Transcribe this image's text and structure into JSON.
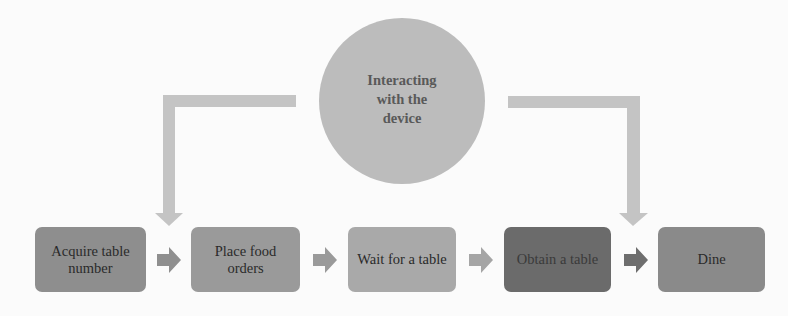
{
  "diagram": {
    "type": "process-flow",
    "hub": {
      "label": "Interacting with the device",
      "fill": "#bcbcbc",
      "text_color": "#595959"
    },
    "connectors": [
      {
        "from": "hub",
        "to": "steps.0",
        "color": "#c4c4c4"
      },
      {
        "from": "hub",
        "to": "steps.4",
        "color": "#c4c4c4"
      }
    ],
    "steps": [
      {
        "label": "Acquire table number",
        "fill": "#8e8e8e"
      },
      {
        "label": "Place food orders",
        "fill": "#9a9a9a"
      },
      {
        "label": "Wait for a table",
        "fill": "#a9a9a9"
      },
      {
        "label": "Obtain a table",
        "fill": "#6b6b6b"
      },
      {
        "label": "Dine",
        "fill": "#8a8a8a"
      }
    ],
    "flow_arrows": [
      {
        "from": 0,
        "to": 1,
        "color": "#8f8f8f"
      },
      {
        "from": 1,
        "to": 2,
        "color": "#9a9a9a"
      },
      {
        "from": 2,
        "to": 3,
        "color": "#a5a5a5"
      },
      {
        "from": 3,
        "to": 4,
        "color": "#6e6e6e"
      }
    ]
  }
}
